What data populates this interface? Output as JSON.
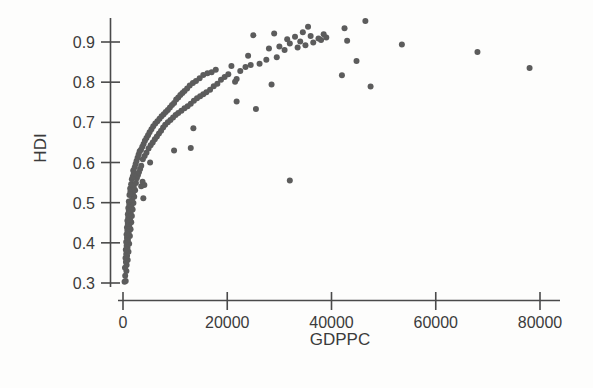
{
  "chart_data": {
    "type": "scatter",
    "title": "",
    "subtitle": "",
    "xlabel": "GDPPC",
    "ylabel": "HDI",
    "xlim": [
      -2000,
      84000
    ],
    "ylim": [
      0.28,
      0.97
    ],
    "xticks": [
      0,
      20000,
      40000,
      60000,
      80000
    ],
    "xtick_labels": [
      "0",
      "20000",
      "40000",
      "60000",
      "80000"
    ],
    "yticks": [
      0.3,
      0.4,
      0.5,
      0.6,
      0.7,
      0.8,
      0.9
    ],
    "ytick_labels": [
      "0.3",
      "0.4",
      "0.5",
      "0.6",
      "0.7",
      "0.8",
      "0.9"
    ],
    "grid": false,
    "legend": null,
    "marker_color": "#5c5c5c",
    "marker_size": 6,
    "annotations": [],
    "points": [
      [
        300,
        0.303
      ],
      [
        520,
        0.305
      ],
      [
        420,
        0.318
      ],
      [
        650,
        0.33
      ],
      [
        380,
        0.338
      ],
      [
        700,
        0.345
      ],
      [
        560,
        0.352
      ],
      [
        900,
        0.357
      ],
      [
        480,
        0.362
      ],
      [
        780,
        0.368
      ],
      [
        620,
        0.372
      ],
      [
        1050,
        0.378
      ],
      [
        540,
        0.383
      ],
      [
        860,
        0.388
      ],
      [
        700,
        0.393
      ],
      [
        1180,
        0.398
      ],
      [
        610,
        0.402
      ],
      [
        950,
        0.407
      ],
      [
        760,
        0.412
      ],
      [
        1320,
        0.417
      ],
      [
        680,
        0.421
      ],
      [
        1080,
        0.425
      ],
      [
        840,
        0.43
      ],
      [
        1450,
        0.434
      ],
      [
        760,
        0.438
      ],
      [
        1200,
        0.442
      ],
      [
        920,
        0.447
      ],
      [
        1580,
        0.451
      ],
      [
        840,
        0.455
      ],
      [
        1330,
        0.459
      ],
      [
        1010,
        0.463
      ],
      [
        1700,
        0.467
      ],
      [
        930,
        0.471
      ],
      [
        1460,
        0.475
      ],
      [
        1110,
        0.479
      ],
      [
        1850,
        0.483
      ],
      [
        1020,
        0.487
      ],
      [
        1590,
        0.491
      ],
      [
        1210,
        0.495
      ],
      [
        2000,
        0.499
      ],
      [
        1120,
        0.503
      ],
      [
        1720,
        0.507
      ],
      [
        3900,
        0.511
      ],
      [
        2150,
        0.515
      ],
      [
        1240,
        0.519
      ],
      [
        1880,
        0.523
      ],
      [
        1420,
        0.527
      ],
      [
        2320,
        0.531
      ],
      [
        1380,
        0.535
      ],
      [
        2060,
        0.539
      ],
      [
        3500,
        0.541
      ],
      [
        4100,
        0.544
      ],
      [
        1560,
        0.546
      ],
      [
        2480,
        0.549
      ],
      [
        3750,
        0.552
      ],
      [
        32000,
        0.555
      ],
      [
        1700,
        0.558
      ],
      [
        2650,
        0.561
      ],
      [
        1880,
        0.565
      ],
      [
        2850,
        0.568
      ],
      [
        2050,
        0.572
      ],
      [
        3050,
        0.576
      ],
      [
        1960,
        0.58
      ],
      [
        3280,
        0.584
      ],
      [
        2250,
        0.588
      ],
      [
        3500,
        0.592
      ],
      [
        2420,
        0.596
      ],
      [
        5200,
        0.6
      ],
      [
        2600,
        0.604
      ],
      [
        3800,
        0.608
      ],
      [
        2800,
        0.612
      ],
      [
        4150,
        0.616
      ],
      [
        3000,
        0.62
      ],
      [
        4500,
        0.624
      ],
      [
        3200,
        0.628
      ],
      [
        9800,
        0.63
      ],
      [
        3450,
        0.632
      ],
      [
        4900,
        0.635
      ],
      [
        13000,
        0.636
      ],
      [
        3700,
        0.639
      ],
      [
        5300,
        0.643
      ],
      [
        3950,
        0.646
      ],
      [
        5700,
        0.65
      ],
      [
        4200,
        0.654
      ],
      [
        6100,
        0.658
      ],
      [
        4500,
        0.661
      ],
      [
        6500,
        0.665
      ],
      [
        4800,
        0.668
      ],
      [
        6900,
        0.672
      ],
      [
        5100,
        0.675
      ],
      [
        7300,
        0.679
      ],
      [
        5450,
        0.683
      ],
      [
        13500,
        0.685
      ],
      [
        7700,
        0.687
      ],
      [
        5800,
        0.69
      ],
      [
        8100,
        0.694
      ],
      [
        6200,
        0.697
      ],
      [
        8600,
        0.7
      ],
      [
        6600,
        0.703
      ],
      [
        9100,
        0.706
      ],
      [
        7000,
        0.709
      ],
      [
        9600,
        0.712
      ],
      [
        7400,
        0.715
      ],
      [
        10100,
        0.718
      ],
      [
        7800,
        0.72
      ],
      [
        10600,
        0.723
      ],
      [
        8200,
        0.726
      ],
      [
        11200,
        0.729
      ],
      [
        8600,
        0.731
      ],
      [
        25500,
        0.733
      ],
      [
        11800,
        0.735
      ],
      [
        9000,
        0.737
      ],
      [
        12400,
        0.74
      ],
      [
        9400,
        0.743
      ],
      [
        13000,
        0.746
      ],
      [
        9800,
        0.748
      ],
      [
        21800,
        0.752
      ],
      [
        13600,
        0.754
      ],
      [
        10200,
        0.757
      ],
      [
        14200,
        0.76
      ],
      [
        10600,
        0.762
      ],
      [
        14800,
        0.765
      ],
      [
        11000,
        0.768
      ],
      [
        15400,
        0.77
      ],
      [
        11400,
        0.773
      ],
      [
        16000,
        0.775
      ],
      [
        11800,
        0.778
      ],
      [
        16700,
        0.781
      ],
      [
        12300,
        0.784
      ],
      [
        47500,
        0.789
      ],
      [
        17400,
        0.79
      ],
      [
        12800,
        0.792
      ],
      [
        28500,
        0.794
      ],
      [
        18100,
        0.796
      ],
      [
        13400,
        0.798
      ],
      [
        21500,
        0.801
      ],
      [
        14000,
        0.803
      ],
      [
        18800,
        0.806
      ],
      [
        21800,
        0.808
      ],
      [
        14700,
        0.81
      ],
      [
        19500,
        0.813
      ],
      [
        42000,
        0.817
      ],
      [
        15400,
        0.818
      ],
      [
        20200,
        0.82
      ],
      [
        16200,
        0.822
      ],
      [
        17000,
        0.825
      ],
      [
        22500,
        0.828
      ],
      [
        17800,
        0.831
      ],
      [
        78000,
        0.835
      ],
      [
        23500,
        0.838
      ],
      [
        20800,
        0.84
      ],
      [
        24500,
        0.843
      ],
      [
        26200,
        0.846
      ],
      [
        44800,
        0.853
      ],
      [
        27500,
        0.856
      ],
      [
        29500,
        0.862
      ],
      [
        24000,
        0.866
      ],
      [
        68000,
        0.875
      ],
      [
        31000,
        0.88
      ],
      [
        28000,
        0.884
      ],
      [
        33500,
        0.886
      ],
      [
        30000,
        0.889
      ],
      [
        35000,
        0.892
      ],
      [
        53500,
        0.894
      ],
      [
        32000,
        0.896
      ],
      [
        36500,
        0.899
      ],
      [
        34000,
        0.901
      ],
      [
        43000,
        0.903
      ],
      [
        38000,
        0.905
      ],
      [
        31500,
        0.907
      ],
      [
        37500,
        0.909
      ],
      [
        39000,
        0.911
      ],
      [
        33000,
        0.913
      ],
      [
        36000,
        0.915
      ],
      [
        25000,
        0.917
      ],
      [
        38500,
        0.919
      ],
      [
        29000,
        0.921
      ],
      [
        34500,
        0.924
      ],
      [
        42500,
        0.934
      ],
      [
        35500,
        0.938
      ],
      [
        46500,
        0.952
      ]
    ]
  },
  "axes": {
    "y_axis_name": "hdi-axis",
    "x_axis_name": "gdppc-axis"
  }
}
